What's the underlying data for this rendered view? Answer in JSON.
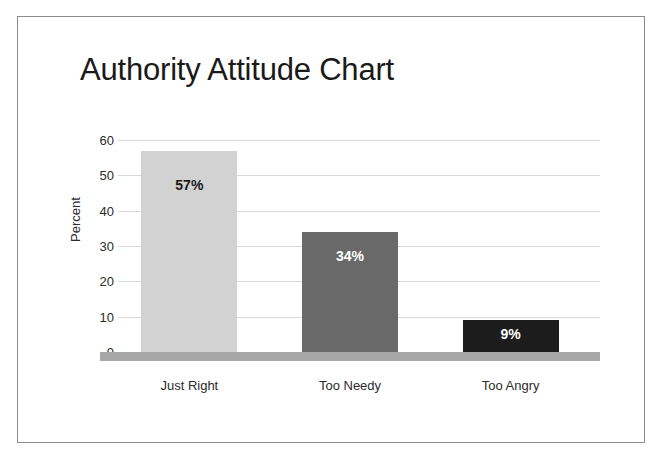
{
  "chart_data": {
    "type": "bar",
    "title": "Authority Attitude Chart",
    "xlabel": "",
    "ylabel": "Percent",
    "categories": [
      "Just Right",
      "Too Needy",
      "Too Angry"
    ],
    "values": [
      57,
      34,
      9
    ],
    "data_labels": [
      "57%",
      "34%",
      "9%"
    ],
    "ylim": [
      0,
      60
    ],
    "yticks": [
      0,
      10,
      20,
      30,
      40,
      50,
      60
    ],
    "ytick_labels": [
      "0",
      "10",
      "20",
      "30",
      "40",
      "50",
      "60"
    ],
    "grid": true,
    "legend": false,
    "bar_colors": [
      "#d2d2d2",
      "#696969",
      "#1c1c1c"
    ],
    "label_colors": [
      "#1a1a1a",
      "#ffffff",
      "#ffffff"
    ]
  },
  "figure": {
    "background_color": "#ffffff",
    "border_color": "#8c8c8c",
    "gridline_color": "#d9d9d9",
    "baseline_color": "#a7a7a7",
    "title_color": "#1a1a1a",
    "tick_color": "#2b2b2b"
  }
}
